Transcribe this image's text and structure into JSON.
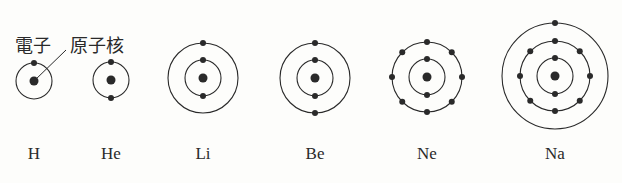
{
  "annotations": {
    "electron": "電子",
    "nucleus": "原子核"
  },
  "colors": {
    "ink": "#2a2a2a",
    "background": "#fdfdfb"
  },
  "atoms": [
    {
      "symbol": "H",
      "cx": 34,
      "cy": 81,
      "shells": [
        1
      ]
    },
    {
      "symbol": "He",
      "cx": 111,
      "cy": 80,
      "shells": [
        2
      ]
    },
    {
      "symbol": "Li",
      "cx": 203,
      "cy": 78,
      "shells": [
        2,
        1
      ]
    },
    {
      "symbol": "Be",
      "cx": 315,
      "cy": 78,
      "shells": [
        2,
        2
      ]
    },
    {
      "symbol": "Ne",
      "cx": 427,
      "cy": 77,
      "shells": [
        2,
        8
      ]
    },
    {
      "symbol": "Na",
      "cx": 555,
      "cy": 76,
      "shells": [
        2,
        8,
        1
      ]
    }
  ]
}
